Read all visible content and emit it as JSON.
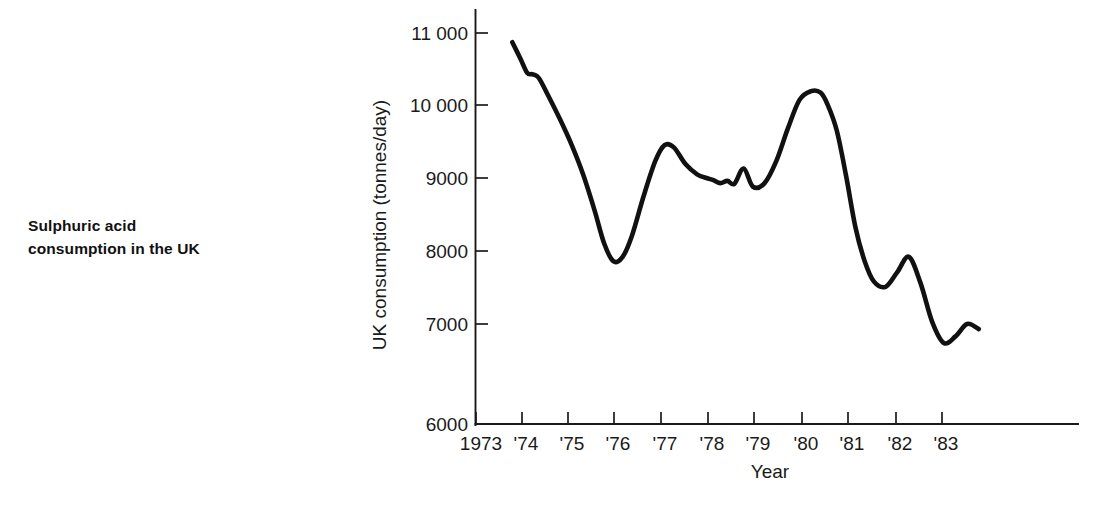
{
  "figure": {
    "caption_lines": [
      "Sulphuric acid",
      "consumption in the UK"
    ]
  },
  "chart_data": {
    "type": "line",
    "title": "",
    "xlabel": "Year",
    "ylabel": "UK consumption (tonnes/day)",
    "xlim": [
      1973,
      1984
    ],
    "ylim": [
      6000,
      11400
    ],
    "grid": false,
    "legend": null,
    "x_tick_labels": [
      "1973",
      "'74",
      "'75",
      "'76",
      "'77",
      "'78",
      "'79",
      "'80",
      "'81",
      "'82",
      "'83"
    ],
    "x_tick_values": [
      1973,
      1974,
      1975,
      1976,
      1977,
      1978,
      1979,
      1980,
      1981,
      1982,
      1983
    ],
    "y_tick_labels": [
      "6000",
      "7000",
      "8000",
      "9000",
      "10 000",
      "11 000"
    ],
    "y_tick_values": [
      6000,
      7000,
      8000,
      9000,
      10000,
      11000
    ],
    "series": [
      {
        "name": "UK sulphuric acid consumption",
        "color": "#111111",
        "x": [
          1973.78,
          1973.95,
          1974.1,
          1974.22,
          1974.35,
          1974.55,
          1974.8,
          1975.05,
          1975.3,
          1975.55,
          1975.75,
          1975.95,
          1976.15,
          1976.35,
          1976.6,
          1976.85,
          1977.05,
          1977.25,
          1977.5,
          1977.75,
          1977.95,
          1978.1,
          1978.25,
          1978.4,
          1978.55,
          1978.75,
          1978.95,
          1979.2,
          1979.45,
          1979.7,
          1979.95,
          1980.2,
          1980.4,
          1980.55,
          1980.75,
          1980.95,
          1981.15,
          1981.35,
          1981.55,
          1981.8,
          1982.05,
          1982.3,
          1982.55,
          1982.8,
          1983.05,
          1983.3,
          1983.55,
          1983.8
        ],
        "y": [
          11230,
          11010,
          10810,
          10790,
          10740,
          10500,
          10180,
          9830,
          9420,
          8920,
          8480,
          8230,
          8290,
          8580,
          9120,
          9600,
          9820,
          9790,
          9560,
          9420,
          9370,
          9340,
          9300,
          9330,
          9290,
          9500,
          9250,
          9300,
          9600,
          10050,
          10440,
          10560,
          10540,
          10380,
          10020,
          9400,
          8700,
          8230,
          7950,
          7880,
          8080,
          8290,
          7930,
          7400,
          7110,
          7200,
          7370,
          7300
        ]
      }
    ],
    "notable_points": {
      "start_value": 11230,
      "peak_1980": 10560,
      "trough_1976": 8230,
      "trough_1982": 7110,
      "end_value": 7550
    }
  }
}
